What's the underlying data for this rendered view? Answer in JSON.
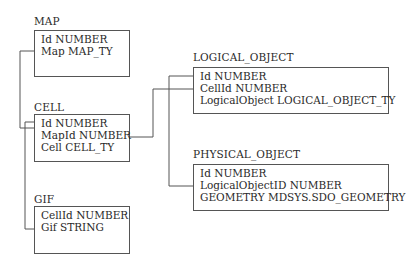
{
  "entities": [
    {
      "name": "MAP",
      "fields": [
        "Id NUMBER",
        "Map MAP_TY"
      ]
    },
    {
      "name": "CELL",
      "fields": [
        "Id NUMBER",
        "MapId NUMBER",
        "Cell CELL_TY"
      ]
    },
    {
      "name": "GIF",
      "fields": [
        "CellId NUMBER",
        "Gif STRING"
      ]
    },
    {
      "name": "LOGICAL_OBJECT",
      "fields": [
        "Id NUMBER",
        "CellId NUMBER",
        "LogicalObject LOGICAL_OBJECT_TY"
      ]
    },
    {
      "name": "PHYSICAL_OBJECT",
      "fields": [
        "Id NUMBER",
        "LogicalObjectID NUMBER",
        "GEOMETRY MDSYS.SDO_GEOMETRY"
      ]
    }
  ],
  "relationships": [
    {
      "from": "MAP.Id",
      "to": "CELL.MapId"
    },
    {
      "from": "CELL.Id",
      "to": "GIF.CellId"
    },
    {
      "from": "CELL.Id",
      "to": "LOGICAL_OBJECT.CellId"
    },
    {
      "from": "LOGICAL_OBJECT.Id",
      "to": "PHYSICAL_OBJECT.LogicalObjectID"
    }
  ]
}
